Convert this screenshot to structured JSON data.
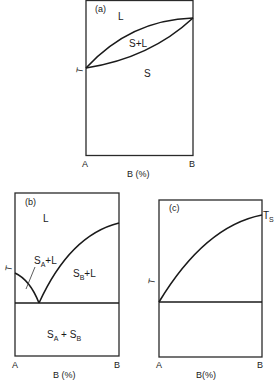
{
  "figure": {
    "panels": [
      {
        "id": "a",
        "panel_label": "(a)",
        "regions": {
          "liquid": "L",
          "two_phase": "S+L",
          "solid": "S"
        },
        "y_axis_label": "T",
        "x_left": "A",
        "x_right": "B",
        "x_axis_label": "B (%)"
      },
      {
        "id": "b",
        "panel_label": "(b)",
        "regions": {
          "liquid": "L",
          "sa_l_main": "S",
          "sa_l_sub": "A",
          "sa_l_rest": "+L",
          "sb_l_main": "S",
          "sb_l_sub": "B",
          "sb_l_rest": "+L",
          "sa_sb_main1": "S",
          "sa_sb_sub1": "A",
          "sa_sb_plus": " + S",
          "sa_sb_sub2": "B"
        },
        "y_axis_label": "T",
        "x_left": "A",
        "x_right": "B",
        "x_axis_label": "B (%)"
      },
      {
        "id": "c",
        "panel_label": "(c)",
        "end_label_main": "T",
        "end_label_sub": "S",
        "y_axis_label": "T",
        "x_left": "A",
        "x_right": "B",
        "x_axis_label": "B(%)"
      }
    ],
    "colors": {
      "ink": "#1a1a1a",
      "background": "#ffffff"
    }
  }
}
